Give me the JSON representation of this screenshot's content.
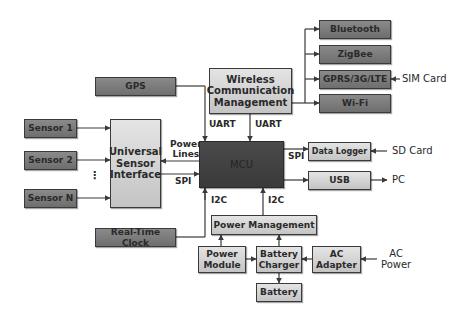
{
  "diagram": {
    "title": "",
    "blocks": {
      "bluetooth": "Bluetooth",
      "zigbee": "ZigBee",
      "gprs": "GPRS/3G/LTE",
      "wifi": "Wi-Fi",
      "wireless_line1": "Wireless",
      "wireless_line2": "Communication",
      "wireless_line3": "Management",
      "gps": "GPS",
      "sensor1": "Sensor 1",
      "sensor2": "Sensor 2",
      "sensorN": "Sensor N",
      "usi_line1": "Universal",
      "usi_line2": "Sensor",
      "usi_line3": "Interface",
      "mcu": "MCU",
      "data_logger": "Data Logger",
      "usb": "USB",
      "rtc": "Real-Time Clock",
      "power_management": "Power Management",
      "power_module_line1": "Power",
      "power_module_line2": "Module",
      "battery_charger_line1": "Battery",
      "battery_charger_line2": "Charger",
      "ac_adapter_line1": "AC",
      "ac_adapter_line2": "Adapter",
      "battery": "Battery"
    },
    "labels": {
      "sim_card": "SIM Card",
      "sd_card": "SD Card",
      "pc": "PC",
      "ac_power_line1": "AC",
      "ac_power_line2": "Power",
      "uart_left": "UART",
      "uart_right": "UART",
      "power_lines_line1": "Power",
      "power_lines_line2": "Lines",
      "spi_left": "SPI",
      "spi_right": "SPI",
      "i2c_left": "I2C",
      "i2c_right": "I2C",
      "ellipsis": "⋮"
    },
    "colors": {
      "dark_block": "#7a7a7a",
      "light_block": "#d2d2d2",
      "mcu_block": "#424242",
      "line": "#3a3a3a"
    }
  }
}
